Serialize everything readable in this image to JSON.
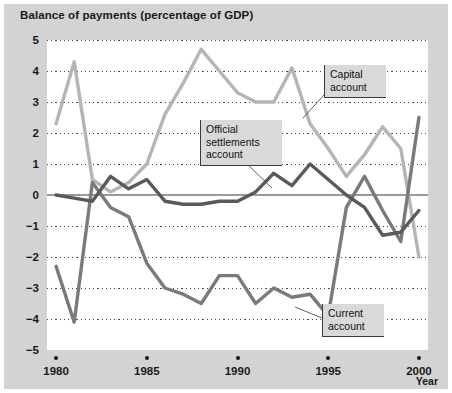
{
  "chart_data": {
    "type": "line",
    "title": "Balance of payments (percentage of GDP)",
    "xlabel": "Year",
    "ylabel": "",
    "xlim": [
      1979.5,
      2000.5
    ],
    "ylim": [
      -5,
      5
    ],
    "grid": true,
    "legend_position": "inline-annotations",
    "x_tick_labels": [
      "1980",
      "1985",
      "1990",
      "1995",
      "2000"
    ],
    "x_tick_values": [
      1980,
      1985,
      1990,
      1995,
      2000
    ],
    "y_tick_labels": [
      "5",
      "4",
      "3",
      "2",
      "1",
      "0",
      "−1",
      "−2",
      "−3",
      "−4",
      "−5"
    ],
    "y_tick_values": [
      5,
      4,
      3,
      2,
      1,
      0,
      -1,
      -2,
      -3,
      -4,
      -5
    ],
    "x": [
      1980,
      1981,
      1982,
      1983,
      1984,
      1985,
      1986,
      1987,
      1988,
      1989,
      1990,
      1991,
      1992,
      1993,
      1994,
      1995,
      1996,
      1997,
      1998,
      1999,
      2000
    ],
    "series": [
      {
        "name": "Capital account",
        "color": "#b5b5b5",
        "values": [
          2.3,
          4.3,
          0.5,
          0.1,
          0.4,
          1.0,
          2.6,
          3.6,
          4.7,
          4.0,
          3.3,
          3.0,
          3.0,
          4.1,
          2.3,
          1.5,
          0.6,
          1.3,
          2.2,
          1.5,
          -2.0
        ]
      },
      {
        "name": "Official settlements account",
        "color": "#5a5a5a",
        "values": [
          0.0,
          -0.1,
          -0.2,
          0.6,
          0.2,
          0.5,
          -0.2,
          -0.3,
          -0.3,
          -0.2,
          -0.2,
          0.1,
          0.7,
          0.3,
          1.0,
          0.5,
          0.0,
          -0.4,
          -1.3,
          -1.2,
          -0.5
        ]
      },
      {
        "name": "Current account",
        "color": "#7a7a7a",
        "values": [
          -2.3,
          -4.1,
          0.4,
          -0.4,
          -0.7,
          -2.2,
          -3.0,
          -3.2,
          -3.5,
          -2.6,
          -2.6,
          -3.5,
          -3.0,
          -3.3,
          -3.2,
          -3.9,
          -0.4,
          0.6,
          -0.5,
          -1.5,
          2.5
        ]
      }
    ],
    "annotations": [
      {
        "label": "Capital account",
        "text_lines": "Capital\naccount",
        "box_left": 324,
        "box_top": 65,
        "box_width": 62,
        "leader_from": [
          324,
          95
        ],
        "leader_to": [
          303,
          118
        ]
      },
      {
        "label": "Official settlements account",
        "text_lines": "Official\nsettlements\naccount",
        "box_left": 200,
        "box_top": 120,
        "box_width": 82,
        "leader_from": [
          246,
          163
        ],
        "leader_to": [
          272,
          188
        ]
      },
      {
        "label": "Current account",
        "text_lines": "Current\naccount",
        "box_left": 322,
        "box_top": 304,
        "box_width": 62,
        "leader_from": [
          322,
          318
        ],
        "leader_to": [
          295,
          307
        ]
      }
    ]
  }
}
